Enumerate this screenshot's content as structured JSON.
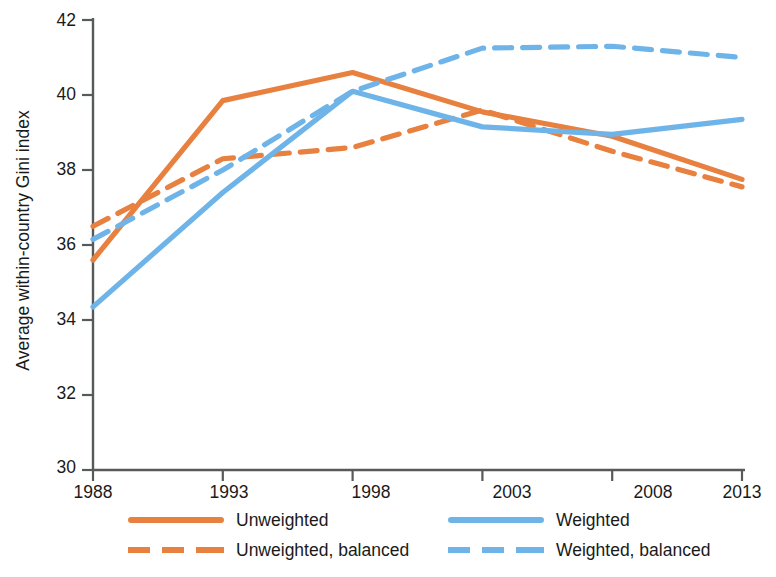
{
  "chart_data": {
    "type": "line",
    "title": "",
    "xlabel": "",
    "ylabel": "Average within-country Gini index",
    "x": [
      1988,
      1993,
      1998,
      2003,
      2008,
      2013
    ],
    "xtick_labels": [
      "1988",
      "1993",
      "1998",
      "2003",
      "2008",
      "2013"
    ],
    "ytick_labels": [
      "30",
      "32",
      "34",
      "36",
      "38",
      "40",
      "42"
    ],
    "yticks": [
      30,
      32,
      34,
      36,
      38,
      40,
      42
    ],
    "ylim": [
      30,
      42
    ],
    "xlim": [
      1988,
      2013
    ],
    "grid": false,
    "legend_position": "bottom",
    "series": [
      {
        "name": "Unweighted",
        "color": "#E8813F",
        "style": "solid",
        "values": [
          35.6,
          39.85,
          40.6,
          39.55,
          38.9,
          37.75
        ]
      },
      {
        "name": "Unweighted, balanced",
        "color": "#E8813F",
        "style": "dashed",
        "values": [
          36.5,
          38.3,
          38.6,
          39.6,
          38.5,
          37.55
        ]
      },
      {
        "name": "Weighted",
        "color": "#6FB4E8",
        "style": "solid",
        "values": [
          34.35,
          37.4,
          40.1,
          39.15,
          38.95,
          39.35
        ]
      },
      {
        "name": "Weighted, balanced",
        "color": "#6FB4E8",
        "style": "dashed",
        "values": [
          36.15,
          38.0,
          40.1,
          41.25,
          41.3,
          41.0
        ]
      }
    ]
  },
  "legend": {
    "entries": [
      {
        "label": "Unweighted",
        "swatch": "solid-orange"
      },
      {
        "label": "Weighted",
        "swatch": "solid-blue"
      },
      {
        "label": "Unweighted, balanced",
        "swatch": "dashed-orange"
      },
      {
        "label": "Weighted, balanced",
        "swatch": "dashed-blue"
      }
    ]
  },
  "colors": {
    "orange": "#E8813F",
    "blue": "#6FB4E8",
    "axis": "#58595B",
    "text": "#1a1a1a"
  }
}
